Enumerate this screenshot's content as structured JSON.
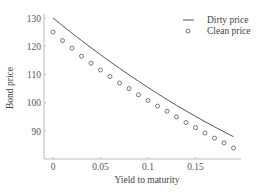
{
  "chart_data": {
    "type": "line",
    "title": "",
    "xlabel": "Yield to maturity",
    "ylabel": "Bond price",
    "xlim": [
      0,
      0.19
    ],
    "ylim": [
      80,
      132
    ],
    "x_ticks": [
      0,
      0.05,
      0.1,
      0.15
    ],
    "x_tick_labels": [
      "0",
      "0.05",
      "0.1",
      "0.15"
    ],
    "y_ticks": [
      90,
      100,
      110,
      120,
      130
    ],
    "y_tick_labels": [
      "90",
      "100",
      "110",
      "120",
      "130"
    ],
    "grid": false,
    "legend_position": "upper right",
    "x": [
      0,
      0.01,
      0.02,
      0.03,
      0.04,
      0.05,
      0.06,
      0.07,
      0.08,
      0.09,
      0.1,
      0.11,
      0.12,
      0.13,
      0.14,
      0.15,
      0.16,
      0.17,
      0.18,
      0.19
    ],
    "series": [
      {
        "name": "Dirty price",
        "style": "line",
        "color": "#555555",
        "values": [
          130,
          127.3,
          124.7,
          122.2,
          119.8,
          117.5,
          115.3,
          113.1,
          111,
          109,
          107,
          105.1,
          103.2,
          101.4,
          99.7,
          98,
          96.3,
          94.7,
          93.1,
          88.2
        ]
      },
      {
        "name": "Clean price",
        "style": "markers",
        "marker": "open-circle",
        "color": "#555555",
        "values": [
          125,
          122,
          119.3,
          116.5,
          114,
          111.6,
          109.3,
          107,
          105,
          102.8,
          100.8,
          98.8,
          97,
          95,
          93,
          91.2,
          89.3,
          87.5,
          85.8,
          84
        ]
      }
    ]
  },
  "legend": {
    "items": [
      {
        "label": "Dirty price",
        "symbol": "line"
      },
      {
        "label": "Clean price",
        "symbol": "circle"
      }
    ]
  }
}
